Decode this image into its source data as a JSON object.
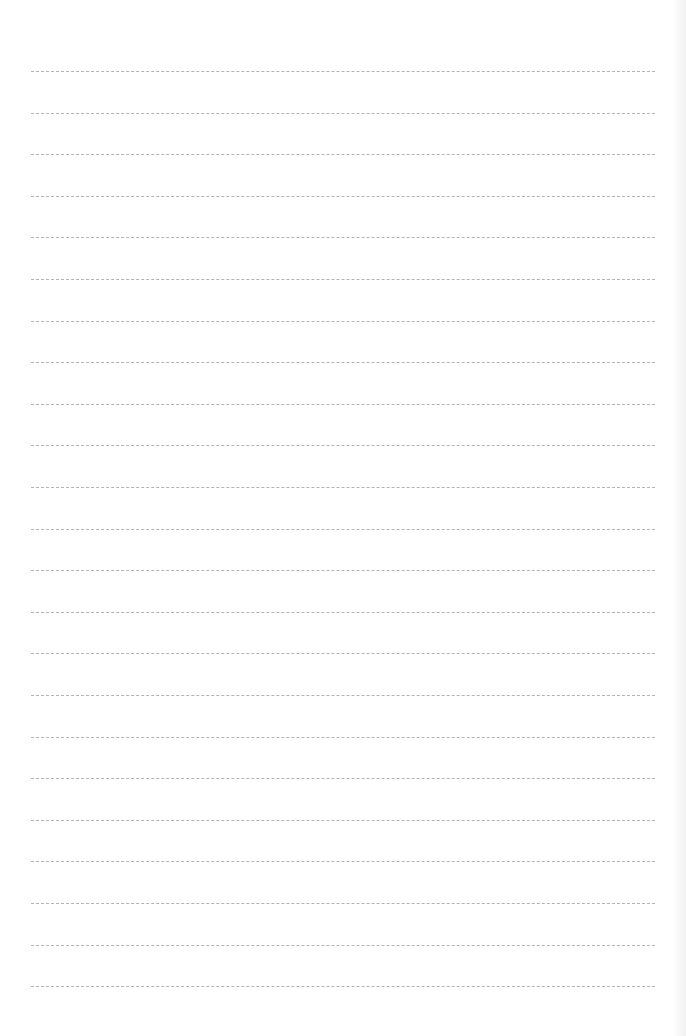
{
  "sheet": {
    "type": "ruled-notebook-page",
    "background_color": "#ffffff",
    "line_color": "#9a9a9a",
    "line_style": "dashed",
    "line_count": 23,
    "first_line_y": 71,
    "line_spacing": 41.6,
    "line_left": 31,
    "line_right": 655,
    "text": ""
  }
}
